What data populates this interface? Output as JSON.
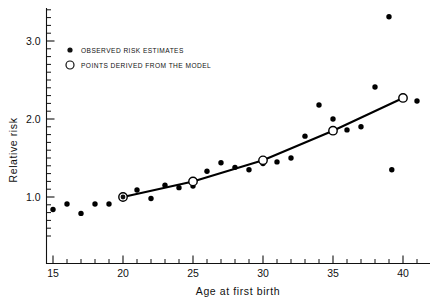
{
  "chart_data": {
    "type": "scatter",
    "title": "",
    "xlabel": "Age at first birth",
    "ylabel": "Relative risk",
    "xlim": [
      14.2,
      41.8
    ],
    "ylim": [
      0.42,
      3.42
    ],
    "xticks": [
      15,
      20,
      25,
      30,
      35,
      40
    ],
    "xtick_labels": [
      "15",
      "20",
      "25",
      "30",
      "35",
      "40"
    ],
    "yticks": [
      1.0,
      2.0,
      3.0
    ],
    "ytick_labels": [
      "1.0",
      "2.0",
      "3.0"
    ],
    "x_minor_step": 1,
    "y_minor_step": 0.1,
    "grid": false,
    "legend_position": "upper left",
    "series": [
      {
        "name": "OBSERVED RISK ESTIMATES",
        "marker": "filled-circle",
        "color": "#000000",
        "points": [
          {
            "x": 15,
            "y": 0.84
          },
          {
            "x": 16,
            "y": 0.91
          },
          {
            "x": 17,
            "y": 0.79
          },
          {
            "x": 18,
            "y": 0.91
          },
          {
            "x": 19,
            "y": 0.91
          },
          {
            "x": 20,
            "y": 1.0
          },
          {
            "x": 21,
            "y": 1.09
          },
          {
            "x": 22,
            "y": 0.98
          },
          {
            "x": 23,
            "y": 1.15
          },
          {
            "x": 24,
            "y": 1.12
          },
          {
            "x": 25,
            "y": 1.14
          },
          {
            "x": 26,
            "y": 1.33
          },
          {
            "x": 27,
            "y": 1.44
          },
          {
            "x": 28,
            "y": 1.38
          },
          {
            "x": 29,
            "y": 1.35
          },
          {
            "x": 30,
            "y": 1.43
          },
          {
            "x": 31,
            "y": 1.45
          },
          {
            "x": 32,
            "y": 1.5
          },
          {
            "x": 33,
            "y": 1.78
          },
          {
            "x": 34,
            "y": 2.18
          },
          {
            "x": 35,
            "y": 2.0
          },
          {
            "x": 36,
            "y": 1.86
          },
          {
            "x": 37,
            "y": 1.9
          },
          {
            "x": 38,
            "y": 2.41
          },
          {
            "x": 39,
            "y": 3.31
          },
          {
            "x": 39.2,
            "y": 1.35
          },
          {
            "x": 41,
            "y": 2.23
          }
        ]
      },
      {
        "name": "POINTS DERIVED FROM THE MODEL",
        "marker": "open-circle",
        "color": "#000000",
        "line": true,
        "points": [
          {
            "x": 20,
            "y": 1.0
          },
          {
            "x": 25,
            "y": 1.2
          },
          {
            "x": 30,
            "y": 1.47
          },
          {
            "x": 35,
            "y": 1.85
          },
          {
            "x": 40,
            "y": 2.27
          }
        ]
      }
    ]
  },
  "legend": {
    "items": [
      {
        "label": "OBSERVED RISK ESTIMATES",
        "marker": "filled-circle"
      },
      {
        "label": "POINTS DERIVED FROM THE MODEL",
        "marker": "open-circle"
      }
    ]
  },
  "axes": {
    "x_title": "Age at first birth",
    "y_title": "Relative risk"
  }
}
